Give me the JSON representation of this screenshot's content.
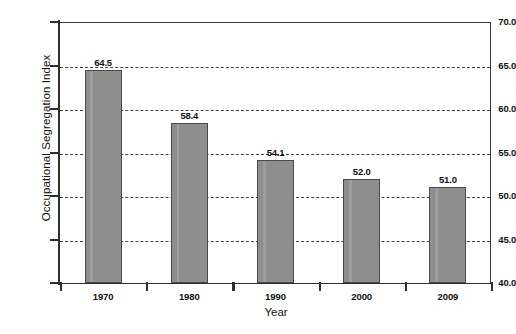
{
  "chart_data": {
    "type": "bar",
    "title": "",
    "xlabel": "Year",
    "ylabel": "Occupational Segregation Index",
    "categories": [
      "1970",
      "1980",
      "1990",
      "2000",
      "2009"
    ],
    "values": [
      64.5,
      58.4,
      54.1,
      52.0,
      51.0
    ],
    "value_labels": [
      "64.5",
      "58.4",
      "54.1",
      "52.0",
      "51.0"
    ],
    "ylim": [
      40.0,
      70.0
    ],
    "ytick_labels": [
      "40.0",
      "45.0",
      "50.0",
      "55.0",
      "60.0",
      "65.0",
      "70.0"
    ],
    "ytick_values": [
      40.0,
      45.0,
      50.0,
      55.0,
      60.0,
      65.0,
      70.0
    ],
    "grid": true,
    "grid_axis": "y",
    "grid_style": "dashed",
    "legend": false,
    "legend_position": "none",
    "bar_color": "#8e8e8e",
    "bar_edge_color": "#4a4a4a",
    "grid_color": "#3f3f55",
    "axis_color": "#2e2e36",
    "background_color": "#ffffff"
  }
}
